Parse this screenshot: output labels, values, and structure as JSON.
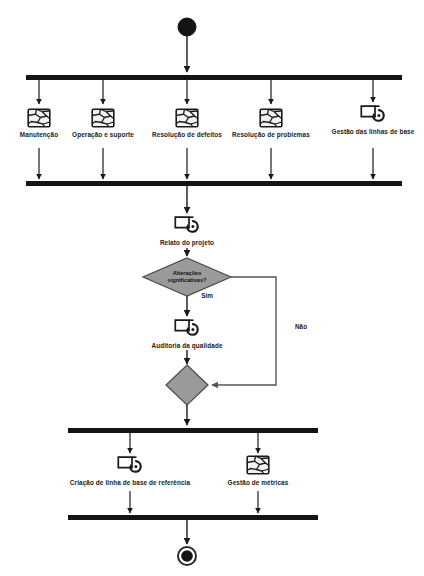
{
  "diagram": {
    "type": "uml-activity-diagram",
    "title": "",
    "colors": {
      "stroke": "#1a1a1a",
      "bar_fill": "#141414",
      "decision_fill": "#9a9a9a",
      "decision_stroke": "#4a4a4a",
      "flow_line": "#555555",
      "icon_stroke": "#1a1a1a",
      "icon_fill": "#f2f2f2",
      "background": "#ffffff"
    },
    "nodes": {
      "start": {
        "name": "start-node",
        "shape": "filled-circle",
        "x": 187,
        "y": 27,
        "r": 9
      },
      "end": {
        "name": "end-node",
        "shape": "ring-circle",
        "x": 187,
        "y": 556,
        "r": 9
      }
    },
    "bars": [
      {
        "name": "fork-bar-top",
        "x": 26,
        "y": 75,
        "width": 376,
        "height": 5
      },
      {
        "name": "join-bar-upper",
        "x": 26,
        "y": 181,
        "width": 376,
        "height": 5
      },
      {
        "name": "fork-bar-lower",
        "x": 68,
        "y": 428,
        "width": 250,
        "height": 5
      },
      {
        "name": "join-bar-bottom",
        "x": 68,
        "y": 515,
        "width": 250,
        "height": 5
      }
    ],
    "activities": [
      {
        "id": "manutencao",
        "label": "Manutenção",
        "icon": "process-map-icon",
        "x": 39,
        "y": 118
      },
      {
        "id": "operacao-suporte",
        "label": "Operação e suporte",
        "icon": "process-map-icon",
        "x": 103,
        "y": 118
      },
      {
        "id": "resolucao-defeitos",
        "label": "Resolução de defeitos",
        "icon": "process-map-icon",
        "x": 187,
        "y": 118
      },
      {
        "id": "resolucao-problemas",
        "label": "Resolução de problemas",
        "icon": "process-map-icon",
        "x": 271,
        "y": 118
      },
      {
        "id": "gestao-linhas-base",
        "label": "Gestão das linhas de base",
        "icon": "baseline-cycle-icon",
        "x": 373,
        "y": 115
      },
      {
        "id": "relato-projeto",
        "label": "Relato do projeto",
        "icon": "baseline-cycle-icon",
        "x": 187,
        "y": 227
      },
      {
        "id": "auditoria-qualidade",
        "label": "Auditoria da qualidade",
        "icon": "baseline-cycle-icon",
        "x": 187,
        "y": 330
      },
      {
        "id": "criacao-linha-base",
        "label": "Criação de linha de base de referência",
        "icon": "baseline-cycle-icon",
        "x": 130,
        "y": 466
      },
      {
        "id": "gestao-metricas",
        "label": "Gestão de métricas",
        "icon": "process-map-icon",
        "x": 258,
        "y": 466
      }
    ],
    "decisions": [
      {
        "id": "alteracoes",
        "name": "decision-node",
        "label": "Alterações significativas?",
        "line1": "Alterações",
        "line2": "significativas?",
        "x": 187,
        "y": 277,
        "rx": 44,
        "ry": 19
      },
      {
        "id": "merge",
        "name": "merge-node",
        "label": "",
        "line1": "",
        "line2": "",
        "x": 187,
        "y": 385,
        "rx": 21,
        "ry": 20
      }
    ],
    "edge_labels": [
      {
        "id": "sim",
        "label": "Sim",
        "x": 207,
        "y": 296
      },
      {
        "id": "nao",
        "label": "Não",
        "x": 301,
        "y": 327
      }
    ]
  }
}
